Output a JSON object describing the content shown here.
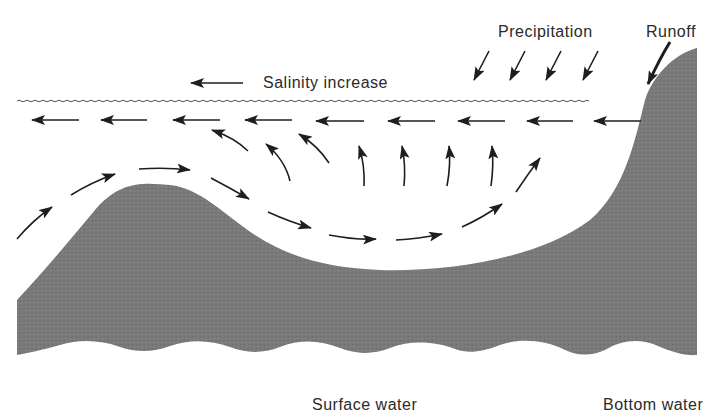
{
  "diagram": {
    "colors": {
      "background": "#ffffff",
      "terrain": "#7a7a7a",
      "arrow": "#1e1e1e",
      "text": "#2a2a2a",
      "water_surface": "#555555"
    },
    "labels": {
      "salinity": "Salinity increase",
      "precipitation": "Precipitation",
      "runoff": "Runoff",
      "surface_water": "Surface water",
      "bottom_water": "Bottom water"
    },
    "elements": {
      "water_surface_line": "wavy water surface",
      "surface_flow_arrows": 10,
      "upwelling_arrows": 8,
      "deep_flow_arrows": 9,
      "precipitation_arrows": 4,
      "runoff_arrows": 1,
      "terrain": "seafloor with sill and coastal slope"
    }
  }
}
